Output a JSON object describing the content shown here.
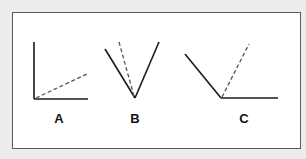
{
  "figure": {
    "colors": {
      "background": "#ececec",
      "panel": "#ffffff",
      "border": "#5a5a5a",
      "stroke": "#1a1a1a",
      "dashed": "#555555"
    },
    "panels": [
      {
        "label": "A",
        "label_x": 59,
        "solid": [
          [
            34,
            42,
            34,
            99
          ],
          [
            34,
            99,
            88,
            99
          ]
        ],
        "dashed": [
          [
            36,
            98,
            87,
            74
          ]
        ]
      },
      {
        "label": "B",
        "label_x": 135,
        "solid": [
          [
            105,
            49,
            135,
            98
          ],
          [
            135,
            98,
            159,
            42
          ]
        ],
        "dashed": [
          [
            134,
            96,
            119,
            42
          ]
        ]
      },
      {
        "label": "C",
        "label_x": 244,
        "solid": [
          [
            185,
            54,
            221,
            98
          ],
          [
            221,
            98,
            278,
            98
          ]
        ],
        "dashed": [
          [
            222,
            97,
            249,
            44
          ]
        ]
      }
    ]
  }
}
